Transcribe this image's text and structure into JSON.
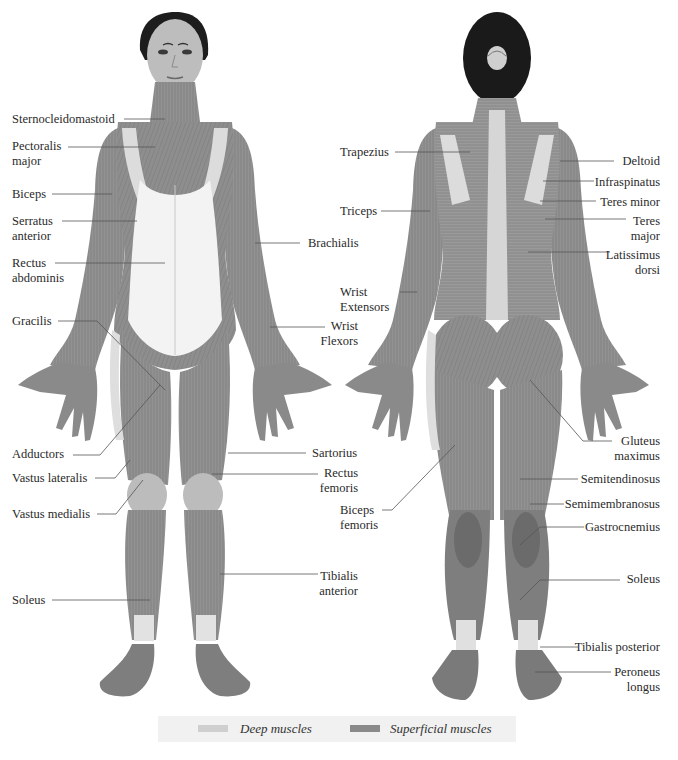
{
  "diagram": {
    "views": [
      "Anterior (front)",
      "Posterior (back)"
    ]
  },
  "front_labels": [
    {
      "text": "Sternocleidomastoid",
      "x": 12,
      "y": 112,
      "align": "left"
    },
    {
      "text": "Pectoralis\nmajor",
      "x": 12,
      "y": 139,
      "align": "left"
    },
    {
      "text": "Biceps",
      "x": 12,
      "y": 187,
      "align": "left"
    },
    {
      "text": "Serratus\nanterior",
      "x": 12,
      "y": 214,
      "align": "left"
    },
    {
      "text": "Rectus\nabdominis",
      "x": 12,
      "y": 256,
      "align": "left"
    },
    {
      "text": "Gracilis",
      "x": 12,
      "y": 314,
      "align": "left"
    },
    {
      "text": "Adductors",
      "x": 12,
      "y": 447,
      "align": "left"
    },
    {
      "text": "Vastus lateralis",
      "x": 12,
      "y": 471,
      "align": "left"
    },
    {
      "text": "Vastus medialis",
      "x": 12,
      "y": 507,
      "align": "left"
    },
    {
      "text": "Soleus",
      "x": 12,
      "y": 593,
      "align": "left"
    },
    {
      "text": "Brachialis",
      "x": 308,
      "y": 236,
      "align": "left"
    },
    {
      "text": "Wrist\nFlexors",
      "x": 300,
      "y": 319,
      "align": "right",
      "w": 58
    },
    {
      "text": "Sartorius",
      "x": 312,
      "y": 446,
      "align": "left"
    },
    {
      "text": "Rectus\nfemoris",
      "x": 300,
      "y": 466,
      "align": "right",
      "w": 58
    },
    {
      "text": "Tibialis\nanterior",
      "x": 300,
      "y": 569,
      "align": "right",
      "w": 58
    }
  ],
  "back_labels": [
    {
      "text": "Trapezius",
      "x": 340,
      "y": 145,
      "align": "left"
    },
    {
      "text": "Triceps",
      "x": 340,
      "y": 204,
      "align": "left"
    },
    {
      "text": "Wrist\nExtensors",
      "x": 340,
      "y": 285,
      "align": "left"
    },
    {
      "text": "Biceps\nfemoris",
      "x": 340,
      "y": 503,
      "align": "left"
    },
    {
      "text": "Deltoid",
      "x": 600,
      "y": 154,
      "align": "right",
      "w": 60
    },
    {
      "text": "Infraspinatus",
      "x": 580,
      "y": 175,
      "align": "right",
      "w": 80
    },
    {
      "text": "Teres minor",
      "x": 580,
      "y": 195,
      "align": "right",
      "w": 80
    },
    {
      "text": "Teres\nmajor",
      "x": 600,
      "y": 214,
      "align": "right",
      "w": 60
    },
    {
      "text": "Latissimus\ndorsi",
      "x": 590,
      "y": 248,
      "align": "right",
      "w": 70
    },
    {
      "text": "Gluteus\nmaximus",
      "x": 600,
      "y": 434,
      "align": "right",
      "w": 60
    },
    {
      "text": "Semitendinosus",
      "x": 560,
      "y": 472,
      "align": "right",
      "w": 100
    },
    {
      "text": "Semimembranosus",
      "x": 550,
      "y": 497,
      "align": "right",
      "w": 110
    },
    {
      "text": "Gastrocnemius",
      "x": 570,
      "y": 520,
      "align": "right",
      "w": 90
    },
    {
      "text": "Soleus",
      "x": 600,
      "y": 572,
      "align": "right",
      "w": 60
    },
    {
      "text": "Tibialis posterior",
      "x": 560,
      "y": 640,
      "align": "right",
      "w": 100
    },
    {
      "text": "Peroneus\nlongus",
      "x": 600,
      "y": 665,
      "align": "right",
      "w": 60
    }
  ],
  "legend": {
    "deep": {
      "label": "Deep muscles",
      "color": "#cfcfcf"
    },
    "superficial": {
      "label": "Superficial muscles",
      "color": "#8a8a8a"
    }
  }
}
